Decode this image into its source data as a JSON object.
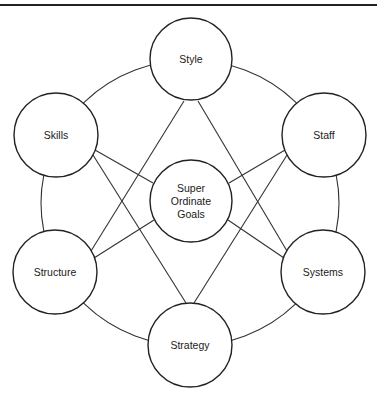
{
  "header": {
    "title": "7-S Framework"
  },
  "diagram": {
    "style": {
      "line_color": "#333333",
      "node_stroke": "#222222",
      "node_fill": "#ffffff"
    },
    "ring": {
      "cx": 190,
      "cy": 203,
      "rx": 149,
      "ry": 143
    },
    "nodes": [
      {
        "id": "style",
        "label": "Style",
        "lines": [
          "Style"
        ],
        "cx": 191,
        "cy": 59,
        "r": 41
      },
      {
        "id": "skills",
        "label": "Skills",
        "lines": [
          "Skills"
        ],
        "cx": 56,
        "cy": 135,
        "r": 42
      },
      {
        "id": "staff",
        "label": "Staff",
        "lines": [
          "Staff"
        ],
        "cx": 324,
        "cy": 135,
        "r": 42
      },
      {
        "id": "super",
        "label": "Super Ordinate Goals",
        "lines": [
          "Super",
          "Ordinate",
          "Goals"
        ],
        "cx": 191,
        "cy": 201,
        "r": 41
      },
      {
        "id": "structure",
        "label": "Structure",
        "lines": [
          "Structure"
        ],
        "cx": 55,
        "cy": 272,
        "r": 42
      },
      {
        "id": "systems",
        "label": "Systems",
        "lines": [
          "Systems"
        ],
        "cx": 323,
        "cy": 272,
        "r": 42
      },
      {
        "id": "strategy",
        "label": "Strategy",
        "lines": [
          "Strategy"
        ],
        "cx": 190,
        "cy": 345,
        "r": 42
      }
    ],
    "edges": [
      {
        "from": "style",
        "to": "structure",
        "x1": 184,
        "y1": 101,
        "x2": 91,
        "y2": 251
      },
      {
        "from": "style",
        "to": "systems",
        "x1": 198,
        "y1": 101,
        "x2": 287,
        "y2": 251
      },
      {
        "from": "skills",
        "to": "super",
        "x1": 95,
        "y1": 150,
        "x2": 153,
        "y2": 183
      },
      {
        "from": "skills",
        "to": "strategy",
        "x1": 93,
        "y1": 155,
        "x2": 186,
        "y2": 303
      },
      {
        "from": "staff",
        "to": "super",
        "x1": 285,
        "y1": 150,
        "x2": 229,
        "y2": 183
      },
      {
        "from": "staff",
        "to": "strategy",
        "x1": 287,
        "y1": 155,
        "x2": 194,
        "y2": 303
      },
      {
        "from": "super",
        "to": "structure",
        "x1": 154,
        "y1": 220,
        "x2": 94,
        "y2": 258
      },
      {
        "from": "super",
        "to": "systems",
        "x1": 228,
        "y1": 220,
        "x2": 284,
        "y2": 258
      }
    ]
  }
}
